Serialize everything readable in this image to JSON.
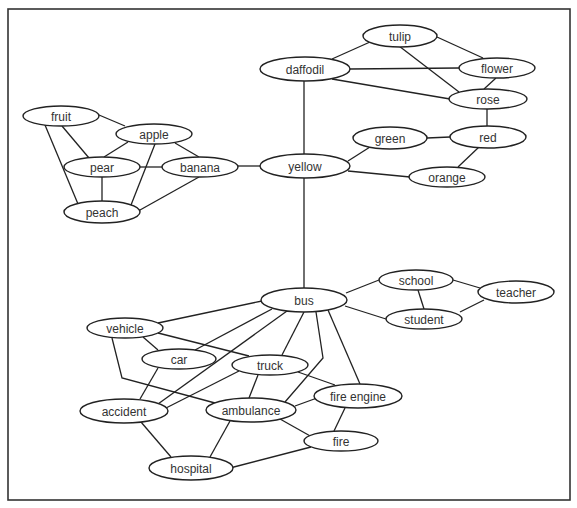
{
  "diagram": {
    "type": "semantic-network",
    "width": 577,
    "height": 508,
    "frame": {
      "x": 8,
      "y": 9,
      "width": 562,
      "height": 491
    },
    "colors": {
      "stroke": "#222222",
      "text": "#333333",
      "background": "#ffffff"
    },
    "nodes": [
      {
        "id": "tulip",
        "label": "tulip",
        "x": 400,
        "y": 36,
        "rx": 37,
        "ry": 11
      },
      {
        "id": "daffodil",
        "label": "daffodil",
        "x": 305,
        "y": 69,
        "rx": 45,
        "ry": 12
      },
      {
        "id": "flower",
        "label": "flower",
        "x": 497,
        "y": 68,
        "rx": 38,
        "ry": 10
      },
      {
        "id": "rose",
        "label": "rose",
        "x": 488,
        "y": 99,
        "rx": 39,
        "ry": 10
      },
      {
        "id": "green",
        "label": "green",
        "x": 390,
        "y": 138,
        "rx": 37,
        "ry": 11
      },
      {
        "id": "red",
        "label": "red",
        "x": 488,
        "y": 137,
        "rx": 38,
        "ry": 11
      },
      {
        "id": "yellow",
        "label": "yellow",
        "x": 305,
        "y": 166,
        "rx": 45,
        "ry": 12
      },
      {
        "id": "orange",
        "label": "orange",
        "x": 447,
        "y": 177,
        "rx": 38,
        "ry": 10
      },
      {
        "id": "fruit",
        "label": "fruit",
        "x": 61,
        "y": 116,
        "rx": 38,
        "ry": 10
      },
      {
        "id": "apple",
        "label": "apple",
        "x": 154,
        "y": 134,
        "rx": 38,
        "ry": 10
      },
      {
        "id": "pear",
        "label": "pear",
        "x": 102,
        "y": 167,
        "rx": 38,
        "ry": 10
      },
      {
        "id": "banana",
        "label": "banana",
        "x": 200,
        "y": 167,
        "rx": 38,
        "ry": 10
      },
      {
        "id": "peach",
        "label": "peach",
        "x": 102,
        "y": 212,
        "rx": 38,
        "ry": 11
      },
      {
        "id": "bus",
        "label": "bus",
        "x": 304,
        "y": 300,
        "rx": 43,
        "ry": 12
      },
      {
        "id": "school",
        "label": "school",
        "x": 416,
        "y": 280,
        "rx": 37,
        "ry": 10
      },
      {
        "id": "teacher",
        "label": "teacher",
        "x": 516,
        "y": 292,
        "rx": 38,
        "ry": 11
      },
      {
        "id": "student",
        "label": "student",
        "x": 424,
        "y": 319,
        "rx": 38,
        "ry": 10
      },
      {
        "id": "vehicle",
        "label": "vehicle",
        "x": 125,
        "y": 328,
        "rx": 38,
        "ry": 10
      },
      {
        "id": "car",
        "label": "car",
        "x": 179,
        "y": 359,
        "rx": 37,
        "ry": 10
      },
      {
        "id": "truck",
        "label": "truck",
        "x": 270,
        "y": 365,
        "rx": 38,
        "ry": 10
      },
      {
        "id": "accident",
        "label": "accident",
        "x": 124,
        "y": 411,
        "rx": 44,
        "ry": 12
      },
      {
        "id": "ambulance",
        "label": "ambulance",
        "x": 251,
        "y": 410,
        "rx": 45,
        "ry": 12
      },
      {
        "id": "fire-engine",
        "label": "fire engine",
        "x": 358,
        "y": 396,
        "rx": 44,
        "ry": 12
      },
      {
        "id": "fire",
        "label": "fire",
        "x": 341,
        "y": 441,
        "rx": 37,
        "ry": 10
      },
      {
        "id": "hospital",
        "label": "hospital",
        "x": 191,
        "y": 468,
        "rx": 42,
        "ry": 12
      }
    ],
    "edges": [
      {
        "from": "tulip",
        "to": "daffodil",
        "points": [
          [
            370,
            42
          ],
          [
            332,
            59
          ]
        ]
      },
      {
        "from": "tulip",
        "to": "flower",
        "points": [
          [
            437,
            37
          ],
          [
            483,
            58
          ]
        ]
      },
      {
        "from": "tulip",
        "to": "rose",
        "points": [
          [
            399,
            46
          ],
          [
            459,
            92
          ]
        ]
      },
      {
        "from": "daffodil",
        "to": "flower",
        "points": [
          [
            350,
            69
          ],
          [
            459,
            68
          ]
        ]
      },
      {
        "from": "daffodil",
        "to": "rose",
        "points": [
          [
            332,
            79
          ],
          [
            450,
            99
          ]
        ]
      },
      {
        "from": "flower",
        "to": "rose",
        "points": [
          [
            496,
            78
          ],
          [
            484,
            89
          ]
        ]
      },
      {
        "from": "daffodil",
        "to": "yellow",
        "points": [
          [
            304,
            81
          ],
          [
            304,
            154
          ]
        ]
      },
      {
        "from": "rose",
        "to": "red",
        "points": [
          [
            487,
            109
          ],
          [
            487,
            126
          ]
        ]
      },
      {
        "from": "green",
        "to": "red",
        "points": [
          [
            427,
            138
          ],
          [
            450,
            137
          ]
        ]
      },
      {
        "from": "red",
        "to": "orange",
        "points": [
          [
            479,
            147
          ],
          [
            458,
            167
          ]
        ]
      },
      {
        "from": "yellow",
        "to": "green",
        "points": [
          [
            348,
            161
          ],
          [
            370,
            147
          ]
        ]
      },
      {
        "from": "yellow",
        "to": "orange",
        "points": [
          [
            348,
            171
          ],
          [
            410,
            177
          ]
        ]
      },
      {
        "from": "banana",
        "to": "yellow",
        "points": [
          [
            238,
            166
          ],
          [
            260,
            166
          ]
        ]
      },
      {
        "from": "fruit",
        "to": "apple",
        "points": [
          [
            99,
            115
          ],
          [
            125,
            126
          ]
        ]
      },
      {
        "from": "fruit",
        "to": "pear",
        "points": [
          [
            62,
            126
          ],
          [
            89,
            158
          ]
        ]
      },
      {
        "from": "fruit",
        "to": "peach",
        "points": [
          [
            45,
            125
          ],
          [
            78,
            204
          ]
        ]
      },
      {
        "from": "apple",
        "to": "pear",
        "points": [
          [
            128,
            142
          ],
          [
            104,
            157
          ]
        ]
      },
      {
        "from": "apple",
        "to": "banana",
        "points": [
          [
            175,
            143
          ],
          [
            199,
            157
          ]
        ]
      },
      {
        "from": "apple",
        "to": "peach",
        "points": [
          [
            155,
            144
          ],
          [
            131,
            205
          ]
        ]
      },
      {
        "from": "pear",
        "to": "banana",
        "points": [
          [
            140,
            167
          ],
          [
            162,
            167
          ]
        ]
      },
      {
        "from": "pear",
        "to": "peach",
        "points": [
          [
            102,
            177
          ],
          [
            102,
            201
          ]
        ]
      },
      {
        "from": "banana",
        "to": "peach",
        "points": [
          [
            199,
            177
          ],
          [
            140,
            210
          ]
        ]
      },
      {
        "from": "yellow",
        "to": "bus",
        "points": [
          [
            304,
            178
          ],
          [
            304,
            288
          ]
        ]
      },
      {
        "from": "bus",
        "to": "school",
        "points": [
          [
            346,
            293
          ],
          [
            379,
            280
          ]
        ]
      },
      {
        "from": "bus",
        "to": "student",
        "points": [
          [
            345,
            306
          ],
          [
            386,
            319
          ]
        ]
      },
      {
        "from": "school",
        "to": "student",
        "points": [
          [
            418,
            290
          ],
          [
            424,
            309
          ]
        ]
      },
      {
        "from": "school",
        "to": "teacher",
        "points": [
          [
            453,
            280
          ],
          [
            480,
            288
          ]
        ]
      },
      {
        "from": "student",
        "to": "teacher",
        "points": [
          [
            460,
            312
          ],
          [
            484,
            300
          ]
        ]
      },
      {
        "from": "bus",
        "to": "vehicle",
        "points": [
          [
            262,
            301
          ],
          [
            158,
            323
          ]
        ]
      },
      {
        "from": "vehicle",
        "to": "car",
        "points": [
          [
            143,
            337
          ],
          [
            158,
            350
          ]
        ]
      },
      {
        "from": "vehicle",
        "to": "truck",
        "points": [
          [
            158,
            333
          ],
          [
            249,
            356
          ]
        ]
      },
      {
        "from": "vehicle",
        "to": "ambulance",
        "points": [
          [
            112,
            338
          ],
          [
            122,
            378
          ],
          [
            215,
            403
          ]
        ]
      },
      {
        "from": "bus",
        "to": "car",
        "points": [
          [
            272,
            309
          ],
          [
            195,
            350
          ]
        ]
      },
      {
        "from": "bus",
        "to": "accident",
        "points": [
          [
            287,
            311
          ],
          [
            158,
            404
          ]
        ]
      },
      {
        "from": "truck",
        "to": "accident",
        "points": [
          [
            239,
            371
          ],
          [
            166,
            408
          ]
        ]
      },
      {
        "from": "car",
        "to": "accident",
        "points": [
          [
            158,
            368
          ],
          [
            140,
            399
          ]
        ]
      },
      {
        "from": "bus",
        "to": "truck",
        "points": [
          [
            304,
            312
          ],
          [
            282,
            355
          ]
        ]
      },
      {
        "from": "bus",
        "to": "ambulance",
        "points": [
          [
            316,
            312
          ],
          [
            323,
            358
          ],
          [
            285,
            402
          ]
        ]
      },
      {
        "from": "bus",
        "to": "fire-engine",
        "points": [
          [
            328,
            310
          ],
          [
            360,
            384
          ]
        ]
      },
      {
        "from": "truck",
        "to": "ambulance",
        "points": [
          [
            258,
            375
          ],
          [
            249,
            398
          ]
        ]
      },
      {
        "from": "truck",
        "to": "fire-engine",
        "points": [
          [
            298,
            372
          ],
          [
            335,
            385
          ]
        ]
      },
      {
        "from": "ambulance",
        "to": "fire-engine",
        "points": [
          [
            295,
            406
          ],
          [
            317,
            398
          ]
        ]
      },
      {
        "from": "ambulance",
        "to": "fire",
        "points": [
          [
            280,
            419
          ],
          [
            312,
            437
          ]
        ]
      },
      {
        "from": "fire-engine",
        "to": "fire",
        "points": [
          [
            345,
            408
          ],
          [
            334,
            431
          ]
        ]
      },
      {
        "from": "accident",
        "to": "hospital",
        "points": [
          [
            141,
            422
          ],
          [
            171,
            457
          ]
        ]
      },
      {
        "from": "ambulance",
        "to": "hospital",
        "points": [
          [
            230,
            421
          ],
          [
            210,
            457
          ]
        ]
      },
      {
        "from": "fire",
        "to": "hospital",
        "points": [
          [
            311,
            447
          ],
          [
            230,
            468
          ]
        ]
      }
    ]
  }
}
